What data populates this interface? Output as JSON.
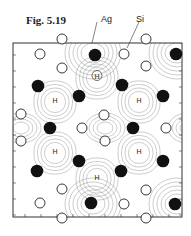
{
  "figure": {
    "label": "Fig. 5.19",
    "annotations": [
      {
        "text": "Ag",
        "x": 101,
        "y": 14
      },
      {
        "text": "Si",
        "x": 136,
        "y": 14
      }
    ],
    "hollow_site_label": "H",
    "frame": {
      "x": 13,
      "y": 43,
      "w": 169,
      "h": 174
    },
    "ag_atoms": [
      {
        "x": 95,
        "y": 55
      },
      {
        "x": 176,
        "y": 54
      },
      {
        "x": 38,
        "y": 86
      },
      {
        "x": 122,
        "y": 85
      },
      {
        "x": 79,
        "y": 96
      },
      {
        "x": 163,
        "y": 96
      },
      {
        "x": 50,
        "y": 128
      },
      {
        "x": 133,
        "y": 128
      },
      {
        "x": 79,
        "y": 161
      },
      {
        "x": 163,
        "y": 161
      },
      {
        "x": 37,
        "y": 171
      },
      {
        "x": 121,
        "y": 171
      },
      {
        "x": 91,
        "y": 203
      },
      {
        "x": 175,
        "y": 204
      }
    ],
    "si_atoms": [
      {
        "x": 62,
        "y": 39
      },
      {
        "x": 146,
        "y": 39
      },
      {
        "x": 40,
        "y": 54
      },
      {
        "x": 124,
        "y": 54
      },
      {
        "x": 62,
        "y": 68
      },
      {
        "x": 146,
        "y": 66
      },
      {
        "x": 21,
        "y": 114
      },
      {
        "x": 104,
        "y": 115
      },
      {
        "x": 82,
        "y": 128
      },
      {
        "x": 166,
        "y": 128
      },
      {
        "x": 21,
        "y": 141
      },
      {
        "x": 105,
        "y": 141
      },
      {
        "x": 62,
        "y": 189
      },
      {
        "x": 146,
        "y": 190
      },
      {
        "x": 40,
        "y": 203
      },
      {
        "x": 124,
        "y": 204
      },
      {
        "x": 62,
        "y": 218
      },
      {
        "x": 146,
        "y": 218
      }
    ],
    "hollow_sites": [
      {
        "x": 97,
        "y": 78,
        "circled": true
      },
      {
        "x": 55,
        "y": 102,
        "circled": false
      },
      {
        "x": 139,
        "y": 102,
        "circled": false
      },
      {
        "x": 55,
        "y": 153,
        "circled": false
      },
      {
        "x": 139,
        "y": 153,
        "circled": false
      },
      {
        "x": 97,
        "y": 179,
        "circled": false
      }
    ]
  }
}
